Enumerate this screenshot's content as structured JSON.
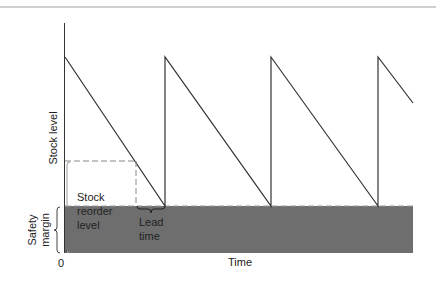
{
  "diagram": {
    "type": "sawtooth inventory diagram",
    "y_axis_label": "Stock level",
    "x_axis_label": "Time",
    "origin_label": "0",
    "safety_margin_label": [
      "Safety",
      "margin"
    ],
    "reorder_level_label": [
      "Stock",
      "reorder",
      "level"
    ],
    "lead_time_label": [
      "Lead",
      "time"
    ],
    "colors": {
      "safety_fill": "#6e6e6e",
      "line": "#333333",
      "dashed": "#888888",
      "rule": "#999999"
    },
    "cycles": [
      {
        "peak_x": 65,
        "trough_x": 165
      },
      {
        "peak_x": 165,
        "trough_x": 271
      },
      {
        "peak_x": 271,
        "trough_x": 378
      },
      {
        "peak_x": 378,
        "trough_x": 413
      }
    ]
  }
}
